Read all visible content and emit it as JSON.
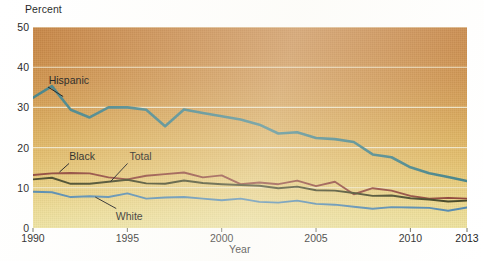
{
  "chart_data": {
    "type": "line",
    "title": "",
    "xlabel": "Year",
    "ylabel": "Percent",
    "xlim": [
      1990,
      2013
    ],
    "ylim": [
      0,
      50
    ],
    "ytick_labels": [
      "0",
      "10",
      "20",
      "30",
      "40",
      "50"
    ],
    "ytick_values": [
      0,
      10,
      20,
      30,
      40,
      50
    ],
    "xtick_labels": [
      "1990",
      "1995",
      "2000",
      "2005",
      "2010",
      "2013"
    ],
    "xtick_values": [
      1990,
      1995,
      2000,
      2005,
      2010,
      2013
    ],
    "grid": "horizontal",
    "legend_position": "inline-annotations",
    "x": [
      1990,
      1991,
      1992,
      1993,
      1994,
      1995,
      1996,
      1997,
      1998,
      1999,
      2000,
      2001,
      2002,
      2003,
      2004,
      2005,
      2006,
      2007,
      2008,
      2009,
      2010,
      2011,
      2012,
      2013
    ],
    "series": [
      {
        "name": "Hispanic",
        "color": "#3f7f86",
        "values": [
          32.4,
          35.3,
          29.4,
          27.5,
          30.0,
          30.0,
          29.4,
          25.3,
          29.5,
          28.6,
          27.8,
          27.0,
          25.7,
          23.5,
          23.8,
          22.4,
          22.1,
          21.4,
          18.3,
          17.6,
          15.1,
          13.6,
          12.7,
          11.7
        ]
      },
      {
        "name": "Black",
        "color": "#8b3f33",
        "values": [
          13.2,
          13.6,
          13.7,
          13.6,
          12.6,
          12.1,
          13.0,
          13.4,
          13.8,
          12.6,
          13.1,
          10.9,
          11.3,
          10.9,
          11.8,
          10.4,
          11.5,
          8.4,
          9.9,
          9.3,
          8.0,
          7.3,
          7.5,
          7.3
        ]
      },
      {
        "name": "Total",
        "color": "#3d3f1e",
        "values": [
          12.1,
          12.5,
          11.0,
          11.0,
          11.5,
          12.0,
          11.1,
          11.0,
          11.8,
          11.2,
          10.9,
          10.7,
          10.5,
          9.9,
          10.3,
          9.4,
          9.3,
          8.7,
          8.0,
          8.1,
          7.4,
          7.1,
          6.6,
          6.8
        ]
      },
      {
        "name": "White",
        "color": "#4d85ad",
        "values": [
          9.0,
          8.9,
          7.7,
          7.9,
          7.7,
          8.6,
          7.3,
          7.6,
          7.7,
          7.3,
          6.9,
          7.3,
          6.5,
          6.3,
          6.8,
          6.0,
          5.8,
          5.3,
          4.8,
          5.2,
          5.1,
          5.0,
          4.3,
          5.1
        ]
      }
    ],
    "annotations": [
      {
        "label": "Hispanic",
        "series": "Hispanic",
        "label_x": 1991.9,
        "label_y": 36.8,
        "anchor_x": 1991.6,
        "anchor_y": 32.7
      },
      {
        "label": "Black",
        "series": "Black",
        "label_x": 1992.6,
        "label_y": 17.8,
        "anchor_x": 1991.4,
        "anchor_y": 13.9
      },
      {
        "label": "Total",
        "series": "Total",
        "label_x": 1995.7,
        "label_y": 17.8,
        "anchor_x": 1994.1,
        "anchor_y": 11.5
      },
      {
        "label": "White",
        "series": "White",
        "label_x": 1995.1,
        "label_y": 3.1,
        "anchor_x": 1993.3,
        "anchor_y": 7.7
      }
    ]
  },
  "axis": {
    "y_title": "Percent",
    "x_title": "Year"
  }
}
